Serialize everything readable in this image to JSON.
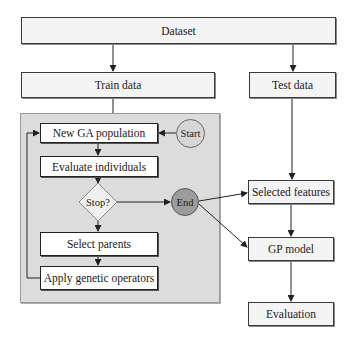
{
  "diagram": {
    "nodes": {
      "dataset": "Dataset",
      "train_data": "Train data",
      "test_data": "Test data",
      "new_ga_population": "New GA population",
      "start": "Start",
      "evaluate_individuals": "Evaluate individuals",
      "stop": "Stop?",
      "end": "End",
      "select_parents": "Select parents",
      "apply_genetic_operators": "Apply genetic operators",
      "selected_features": "Selected features",
      "gp_model": "GP model",
      "evaluation": "Evaluation"
    },
    "edges": [
      {
        "from": "Dataset",
        "to": "Train data"
      },
      {
        "from": "Dataset",
        "to": "Test data"
      },
      {
        "from": "Train data",
        "to": "GA panel"
      },
      {
        "from": "Start",
        "to": "New GA population"
      },
      {
        "from": "New GA population",
        "to": "Evaluate individuals"
      },
      {
        "from": "Evaluate individuals",
        "to": "Stop?"
      },
      {
        "from": "Stop?",
        "to": "End"
      },
      {
        "from": "Stop?",
        "to": "Select parents"
      },
      {
        "from": "Select parents",
        "to": "Apply genetic operators"
      },
      {
        "from": "Apply genetic operators",
        "to": "New GA population"
      },
      {
        "from": "End",
        "to": "Selected features"
      },
      {
        "from": "End",
        "to": "GP model"
      },
      {
        "from": "Test data",
        "to": "Selected features"
      },
      {
        "from": "Selected features",
        "to": "GP model"
      },
      {
        "from": "GP model",
        "to": "Evaluation"
      }
    ],
    "colors": {
      "panel": "#dcdcdc",
      "box": "#f4f4f4",
      "start_fill": "#d6d6d6",
      "end_fill": "#9c9c9c",
      "diamond_fill": "#f0f0f0"
    }
  }
}
